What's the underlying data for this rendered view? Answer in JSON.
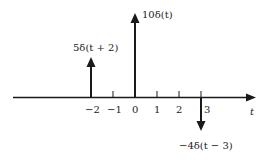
{
  "diagram": {
    "axis_label": "t",
    "ticks": [
      {
        "value": -2,
        "label": "−2",
        "x": 91
      },
      {
        "value": -1,
        "label": "−1",
        "x": 113
      },
      {
        "value": 0,
        "label": "0",
        "x": 135
      },
      {
        "value": 1,
        "label": "1",
        "x": 157
      },
      {
        "value": 2,
        "label": "2",
        "x": 179
      },
      {
        "value": 3,
        "label": "3",
        "x": 201
      }
    ],
    "impulses": [
      {
        "position": -2,
        "weight": 5,
        "label": "5δ(t + 2)"
      },
      {
        "position": 0,
        "weight": 10,
        "label": "10δ(t)"
      },
      {
        "position": 3,
        "weight": -4,
        "label": "−4δ(t − 3)"
      }
    ],
    "colors": {
      "stroke": "#1a1a1a",
      "text": "#222222",
      "background": "#ffffff"
    }
  }
}
